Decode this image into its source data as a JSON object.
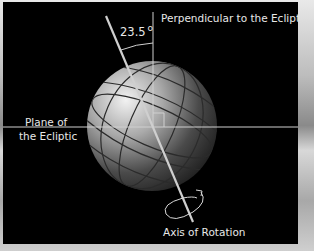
{
  "diagram": {
    "labels": {
      "angle": "23.5",
      "degree_symbol": "o",
      "perpendicular": "Perpendicular to the Ecliptic",
      "plane_line1": "Plane of",
      "plane_line2": "the Ecliptic",
      "axis": "Axis of Rotation"
    },
    "tilt_degrees": 23.5,
    "colors": {
      "panel_background": "#000000",
      "lines": "#d9d9d9",
      "text": "#e8e8e8",
      "globe_light": "#e0e0e0",
      "globe_dark": "#2a2a2a"
    }
  }
}
